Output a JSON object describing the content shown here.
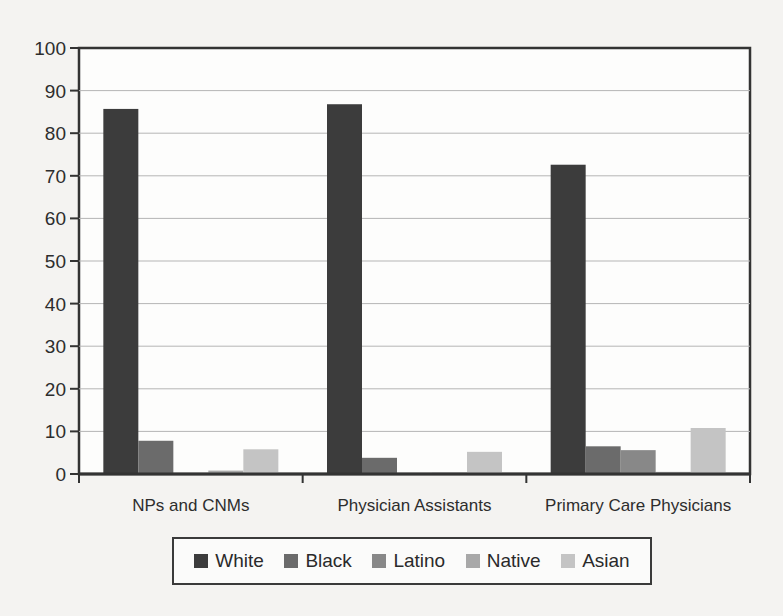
{
  "chart_data": {
    "type": "bar",
    "title": "",
    "xlabel": "",
    "ylabel": "",
    "ylim": [
      0,
      100
    ],
    "yticks": [
      0,
      10,
      20,
      30,
      40,
      50,
      60,
      70,
      80,
      90,
      100
    ],
    "grid": true,
    "legend_position": "bottom",
    "categories": [
      "NPs and CNMs",
      "Physician Assistants",
      "Primary Care Physicians"
    ],
    "series": [
      {
        "name": "White",
        "color": "#3c3c3c",
        "values": [
          85.7,
          86.8,
          72.6
        ]
      },
      {
        "name": "Black",
        "color": "#6b6b6b",
        "values": [
          7.8,
          3.8,
          6.5
        ]
      },
      {
        "name": "Latino",
        "color": "#888888",
        "values": [
          0,
          0,
          5.6
        ]
      },
      {
        "name": "Native",
        "color": "#a8a8a8",
        "values": [
          0.8,
          0.3,
          0.5
        ]
      },
      {
        "name": "Asian",
        "color": "#c4c4c4",
        "values": [
          5.8,
          5.2,
          10.8
        ]
      }
    ]
  },
  "legend": {
    "items": [
      {
        "label": "White",
        "color": "#3c3c3c"
      },
      {
        "label": "Black",
        "color": "#6b6b6b"
      },
      {
        "label": "Latino",
        "color": "#888888"
      },
      {
        "label": "Native",
        "color": "#a8a8a8"
      },
      {
        "label": "Asian",
        "color": "#c4c4c4"
      }
    ]
  }
}
